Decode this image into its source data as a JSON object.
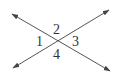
{
  "diagram": {
    "type": "intersecting-lines",
    "lines": [
      {
        "name": "line-a",
        "from": [
          12,
          14
        ],
        "to": [
          110,
          71
        ],
        "arrows": "both"
      },
      {
        "name": "line-b",
        "from": [
          13,
          68
        ],
        "to": [
          109,
          10
        ],
        "arrows": "both"
      }
    ],
    "intersection": [
      57,
      40
    ],
    "angles": [
      {
        "label": "1",
        "position": "left"
      },
      {
        "label": "2",
        "position": "top"
      },
      {
        "label": "3",
        "position": "right"
      },
      {
        "label": "4",
        "position": "bottom"
      }
    ],
    "colors": {
      "line": "#555555",
      "label": "#333333",
      "background": "#ffffff"
    }
  }
}
